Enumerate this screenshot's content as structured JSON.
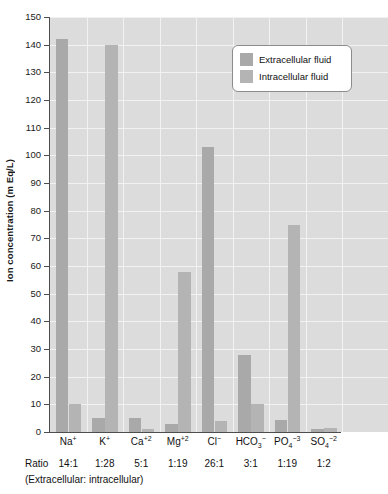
{
  "chart_data": {
    "type": "bar",
    "title": "",
    "xlabel": "",
    "ylabel": "Ion concentration (m Eq/L)",
    "ylim": [
      0,
      150
    ],
    "ytick_step": 10,
    "yticks": [
      0,
      10,
      20,
      30,
      40,
      50,
      60,
      70,
      80,
      90,
      100,
      110,
      120,
      130,
      140,
      150
    ],
    "grid": "horizontal-and-vertical-white-on-gray",
    "legend_position": "upper right",
    "categories": [
      "Na+",
      "K+",
      "Ca+2",
      "Mg+2",
      "Cl-",
      "HCO3-",
      "PO4-3",
      "SO4-2"
    ],
    "category_labels": [
      {
        "base": "Na",
        "sup": "+"
      },
      {
        "base": "K",
        "sup": "+"
      },
      {
        "base": "Ca",
        "sup": "+2"
      },
      {
        "base": "Mg",
        "sup": "+2"
      },
      {
        "base": "Cl",
        "sup": "−"
      },
      {
        "base": "HCO",
        "sub": "3",
        "sup": "−"
      },
      {
        "base": "PO",
        "sub": "4",
        "sup": "−3"
      },
      {
        "base": "SO",
        "sub": "4",
        "sup": "−2"
      }
    ],
    "series": [
      {
        "name": "Extracellular fluid",
        "color": "#a9a9a9",
        "values": [
          142,
          5,
          5,
          3,
          103,
          28,
          4.5,
          1
        ]
      },
      {
        "name": "Intracellular fluid",
        "color": "#b4b4b4",
        "values": [
          10,
          140,
          1,
          58,
          4,
          10,
          75,
          1.5
        ]
      }
    ],
    "annotations": {
      "ratio_row_label": "Ratio",
      "ratio_values": [
        "14:1",
        "1:28",
        "5:1",
        "1:19",
        "26:1",
        "3:1",
        "1:19",
        "1:2"
      ],
      "ratio_caption": "(Extracellular: intracellular)"
    }
  },
  "legend": {
    "items": [
      {
        "label": "Extracellular fluid",
        "swatch": "extra"
      },
      {
        "label": "Intracellular fluid",
        "swatch": "intra"
      }
    ]
  },
  "colors": {
    "plot_background": "#dcdcdc",
    "gridline": "#f2f2f2",
    "axis": "#4d4d4d",
    "extracellular": "#a9a9a9",
    "intracellular": "#b4b4b4",
    "text": "#111111"
  }
}
